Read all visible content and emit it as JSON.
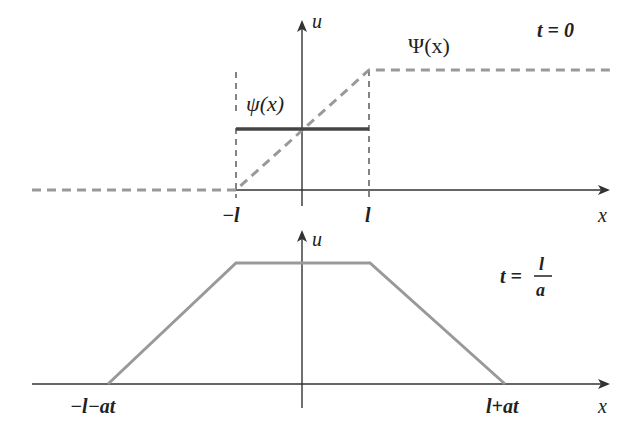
{
  "top_panel": {
    "time_label": "t = 0",
    "axis_x_label": "x",
    "axis_u_label": "u",
    "curve_psi_small_label": "ψ(x)",
    "curve_psi_big_label": "Ψ(x)",
    "tick_neg_l": "−l",
    "tick_pos_l": "l"
  },
  "bottom_panel": {
    "time_label_t": "t =",
    "time_label_num": "l",
    "time_label_den": "a",
    "axis_x_label": "x",
    "axis_u_label": "u",
    "tick_left": "−l−at",
    "tick_right": "l+at"
  },
  "colors": {
    "axis": "#333333",
    "psi_small": "#444444",
    "psi_big_dashed": "#999999",
    "trapezoid": "#999999"
  }
}
